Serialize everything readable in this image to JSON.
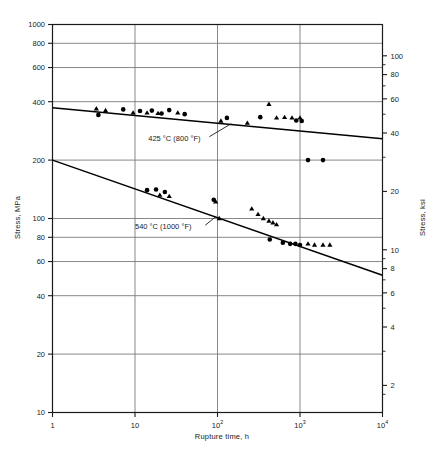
{
  "chart_data": {
    "type": "scatter",
    "title": "",
    "xlabel": "Rupture time, h",
    "ylabel": "Stress, MPa",
    "ylabel_secondary": "Stress, ksi",
    "xscale": "log",
    "yscale": "log",
    "xlim": [
      1,
      10000
    ],
    "ylim": [
      10,
      1000
    ],
    "ylim_secondary": [
      1.45,
      145
    ],
    "grid": true,
    "legend": "none",
    "xticks": [
      {
        "value": 1,
        "label": "1"
      },
      {
        "value": 10,
        "label": "10"
      },
      {
        "value": 100,
        "label": "10",
        "exp": "2"
      },
      {
        "value": 1000,
        "label": "10",
        "exp": "3"
      },
      {
        "value": 10000,
        "label": "10",
        "exp": "4"
      }
    ],
    "yticks_left": [
      {
        "value": 1000,
        "label": "1000"
      },
      {
        "value": 800,
        "label": "800"
      },
      {
        "value": 600,
        "label": "600"
      },
      {
        "value": 400,
        "label": "400"
      },
      {
        "value": 200,
        "label": "200"
      },
      {
        "value": 100,
        "label": "100"
      },
      {
        "value": 80,
        "label": "80"
      },
      {
        "value": 60,
        "label": "60"
      },
      {
        "value": 40,
        "label": "40"
      },
      {
        "value": 20,
        "label": "20"
      },
      {
        "value": 10,
        "label": "10"
      }
    ],
    "yticks_right": [
      {
        "value": 100,
        "label": "100"
      },
      {
        "value": 80,
        "label": "80"
      },
      {
        "value": 60,
        "label": "60"
      },
      {
        "value": 40,
        "label": "40"
      },
      {
        "value": 20,
        "label": "20"
      },
      {
        "value": 10,
        "label": "10"
      },
      {
        "value": 8,
        "label": "8"
      },
      {
        "value": 6,
        "label": "6"
      },
      {
        "value": 4,
        "label": "4"
      },
      {
        "value": 2,
        "label": "2"
      }
    ],
    "annotations": [
      {
        "text": "425 °C (800 °F)",
        "x": 30,
        "y": 252,
        "name": "curve-label-425c"
      },
      {
        "text": "540 °C (1000 °F)",
        "x": 22,
        "y": 88,
        "name": "curve-label-540c"
      }
    ],
    "series": [
      {
        "name": "425 °C (800 °F) fit line",
        "kind": "line",
        "color": "#000000",
        "points": [
          [
            1,
            372
          ],
          [
            10000,
            258
          ]
        ]
      },
      {
        "name": "540 °C (1000 °F) fit line",
        "kind": "line",
        "color": "#000000",
        "points": [
          [
            1,
            200
          ],
          [
            10000,
            51
          ]
        ]
      },
      {
        "name": "425 °C circles",
        "kind": "scatter",
        "marker": "circle",
        "color": "#000000",
        "points": [
          [
            3.6,
            342
          ],
          [
            7.2,
            365
          ],
          [
            11.5,
            358
          ],
          [
            16.0,
            360
          ],
          [
            21.0,
            348
          ],
          [
            26.0,
            362
          ],
          [
            40.0,
            345
          ],
          [
            130,
            330
          ],
          [
            330,
            333
          ],
          [
            900,
            320
          ],
          [
            1050,
            318
          ],
          [
            1250,
            200
          ],
          [
            1900,
            200
          ]
        ]
      },
      {
        "name": "425 °C triangles",
        "kind": "scatter",
        "marker": "triangle",
        "color": "#000000",
        "points": [
          [
            3.4,
            368
          ],
          [
            4.4,
            360
          ],
          [
            9.5,
            350
          ],
          [
            14.0,
            350
          ],
          [
            19.0,
            348
          ],
          [
            33.0,
            350
          ],
          [
            110,
            318
          ],
          [
            230,
            310
          ],
          [
            420,
            388
          ],
          [
            520,
            330
          ],
          [
            650,
            332
          ],
          [
            800,
            330
          ],
          [
            1000,
            330
          ]
        ]
      },
      {
        "name": "540 °C circles",
        "kind": "scatter",
        "marker": "circle",
        "color": "#000000",
        "points": [
          [
            14.0,
            140
          ],
          [
            18.0,
            141
          ],
          [
            23.0,
            137
          ],
          [
            90,
            125
          ],
          [
            430,
            78
          ],
          [
            620,
            75
          ],
          [
            760,
            74
          ],
          [
            880,
            74
          ],
          [
            1000,
            73
          ]
        ]
      },
      {
        "name": "540 °C triangles",
        "kind": "scatter",
        "marker": "triangle",
        "color": "#000000",
        "points": [
          [
            20.0,
            132
          ],
          [
            26.0,
            130
          ],
          [
            95,
            122
          ],
          [
            105,
            100
          ],
          [
            260,
            112
          ],
          [
            310,
            105
          ],
          [
            360,
            100
          ],
          [
            420,
            97
          ],
          [
            470,
            95
          ],
          [
            520,
            93
          ],
          [
            1250,
            74
          ],
          [
            1500,
            73
          ],
          [
            1900,
            73
          ],
          [
            2300,
            73
          ]
        ]
      }
    ]
  },
  "labels": {
    "xlabel": "Rupture time, h",
    "ylabel_left": "Stress, MPa",
    "ylabel_right": "Stress, ksi"
  }
}
